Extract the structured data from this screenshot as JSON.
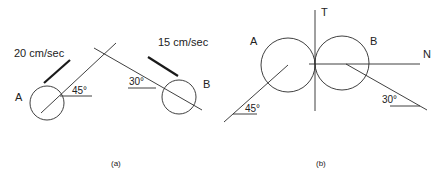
{
  "figure_a": {
    "caption": "(a)",
    "ball_a": {
      "label": "A",
      "speed": "20 cm/sec",
      "angle": "45°"
    },
    "ball_b": {
      "label": "B",
      "speed": "15 cm/sec",
      "angle": "30°"
    }
  },
  "figure_b": {
    "caption": "(b)",
    "ball_a": {
      "label": "A",
      "angle": "45°"
    },
    "ball_b": {
      "label": "B",
      "angle": "30°"
    },
    "tangent_axis": "T",
    "normal_axis": "N"
  },
  "colors": {
    "ink": "#2a2a2a",
    "background": "#ffffff"
  }
}
